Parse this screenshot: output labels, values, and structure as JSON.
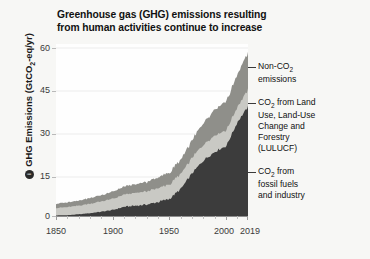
{
  "chart_data": {
    "type": "area",
    "title": "Greenhouse gas (GHG) emissions resulting from human activities continue to increase",
    "xlabel": "",
    "ylabel": "GHG Emissions (GtCO2-eq/yr)",
    "ylabel_prefix": "GHG Emissions (GtCO",
    "ylabel_sub": "2",
    "ylabel_suffix": "-eq/yr)",
    "badge_glyph": "●",
    "xlim": [
      1850,
      2019
    ],
    "ylim": [
      0,
      60
    ],
    "yticks": [
      0,
      15,
      30,
      45,
      60
    ],
    "ytick_labels": [
      "0",
      "15",
      "30",
      "45",
      "60"
    ],
    "xticks": [
      1850,
      1900,
      1950,
      2000,
      2019
    ],
    "xtick_labels": [
      "1850",
      "1900",
      "1950",
      "2000",
      "2019"
    ],
    "grid": "horizontal-light",
    "legend_position": "right-callouts",
    "stacked": true,
    "colors": {
      "fossil": "#3c3c3c",
      "lulucf": "#c9c9c4",
      "nonco2": "#8f8f8a",
      "background": "#f7f7f5",
      "plot_background": "#fefefe",
      "axis": "#8d8d8d",
      "grid": "#ececec",
      "text": "#111111"
    },
    "series": [
      {
        "name": "CO2 from fossil fuels and industry",
        "key": "fossil",
        "label_line1": "CO",
        "label_sub": "2",
        "label_line1b": " from",
        "label_line2": "fossil fuels",
        "label_line3": "and industry",
        "color": "#3c3c3c",
        "x": [
          1850,
          1860,
          1870,
          1880,
          1890,
          1900,
          1910,
          1920,
          1930,
          1940,
          1950,
          1960,
          1970,
          1980,
          1990,
          2000,
          2010,
          2019
        ],
        "values": [
          0.2,
          0.3,
          0.6,
          1.0,
          1.5,
          2.1,
          3.2,
          3.6,
          4.0,
          4.9,
          6.0,
          9.5,
          15.0,
          19.5,
          22.5,
          24.5,
          33.0,
          38.0
        ]
      },
      {
        "name": "CO2 from Land Use, Land-Use Change and Forestry (LULUCF)",
        "key": "lulucf",
        "label_line1": "CO",
        "label_sub": "2",
        "label_line1b": " from Land",
        "label_line2": "Use, Land-Use",
        "label_line3": "Change and",
        "label_line4": "Forestry",
        "label_line5": "(LULUCF)",
        "color": "#c9c9c4",
        "x": [
          1850,
          1860,
          1870,
          1880,
          1890,
          1900,
          1910,
          1920,
          1930,
          1940,
          1950,
          1960,
          1970,
          1980,
          1990,
          2000,
          2010,
          2019
        ],
        "values": [
          2.6,
          2.8,
          3.0,
          3.3,
          3.6,
          3.9,
          4.2,
          4.4,
          4.6,
          4.8,
          5.0,
          5.2,
          5.4,
          5.6,
          5.8,
          5.5,
          5.3,
          6.0
        ]
      },
      {
        "name": "Non-CO2 emissions",
        "key": "nonco2",
        "label_line1": "Non-CO",
        "label_sub": "2",
        "label_line2": "emissions",
        "color": "#8f8f8a",
        "x": [
          1850,
          1860,
          1870,
          1880,
          1890,
          1900,
          1910,
          1920,
          1930,
          1940,
          1950,
          1960,
          1970,
          1980,
          1990,
          2000,
          2010,
          2019
        ],
        "values": [
          1.5,
          1.6,
          1.8,
          2.0,
          2.2,
          2.5,
          2.8,
          3.0,
          3.3,
          3.7,
          4.2,
          5.0,
          6.2,
          7.5,
          9.0,
          10.0,
          11.5,
          13.0
        ]
      }
    ],
    "total_2019": 59.0
  },
  "callouts": {
    "nonco2": {
      "l1": "Non-CO",
      "sub": "2",
      "l2": "emissions"
    },
    "lulucf": {
      "l1": "CO",
      "sub": "2",
      "l1b": " from Land",
      "l2": "Use, Land-Use",
      "l3": "Change and",
      "l4": "Forestry",
      "l5": "(LULUCF)"
    },
    "fossil": {
      "l1": "CO",
      "sub": "2",
      "l1b": " from",
      "l2": "fossil fuels",
      "l3": "and industry"
    }
  }
}
